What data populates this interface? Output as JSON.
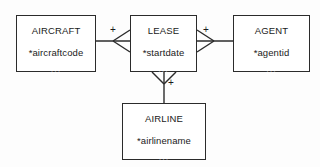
{
  "diagram": {
    "type": "entity-relationship-diagram",
    "notation": "crows-foot",
    "background_color": "#fdfdfd",
    "line_color": "#2b2b2b",
    "text_color": "#1a1a1a",
    "muted_color": "#8a8a8a",
    "entities": [
      {
        "id": "aircraft",
        "name": "AIRCRAFT",
        "attributes": [
          "*aircraftcode"
        ],
        "more": "...",
        "x": 16,
        "y": 15,
        "width": 80,
        "height": 57
      },
      {
        "id": "lease",
        "name": "LEASE",
        "attributes": [
          "*startdate"
        ],
        "more": "...",
        "x": 130,
        "y": 15,
        "width": 67,
        "height": 57
      },
      {
        "id": "agent",
        "name": "AGENT",
        "attributes": [
          "*agentid"
        ],
        "more": "...",
        "x": 233,
        "y": 15,
        "width": 77,
        "height": 57
      },
      {
        "id": "airline",
        "name": "AIRLINE",
        "attributes": [
          "*airlinename"
        ],
        "more": "...",
        "x": 122,
        "y": 103,
        "width": 84,
        "height": 57
      }
    ],
    "relationships": [
      {
        "id": "aircraft-lease",
        "from": "aircraft",
        "to": "lease",
        "crowsfoot_at": "lease",
        "cardinality_label": "+"
      },
      {
        "id": "lease-agent",
        "from": "lease",
        "to": "agent",
        "crowsfoot_at": "lease",
        "cardinality_label": "+"
      },
      {
        "id": "lease-airline",
        "from": "lease",
        "to": "airline",
        "crowsfoot_at": "lease",
        "cardinality_label": "+"
      }
    ],
    "labels": {
      "plus_aircraft_lease": "+",
      "plus_lease_agent": "+",
      "plus_lease_airline": "+"
    }
  }
}
